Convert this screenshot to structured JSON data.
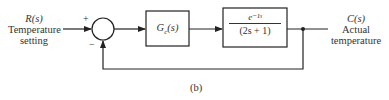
{
  "diagram": {
    "type": "feedback-control-block-diagram",
    "input": {
      "symbol": "R(s)",
      "label": "Temperature setting"
    },
    "output": {
      "symbol": "C(s)",
      "label": "Actual temperature"
    },
    "summing_junction": {
      "plus_sign": "+",
      "minus_sign": "−"
    },
    "controller": {
      "label": "G",
      "subscript": "c",
      "arg": "(s)"
    },
    "plant": {
      "numerator": "e⁻¹ˢ",
      "denominator": "(2s + 1)"
    },
    "feedback": "unity negative feedback",
    "caption": "(b)"
  }
}
